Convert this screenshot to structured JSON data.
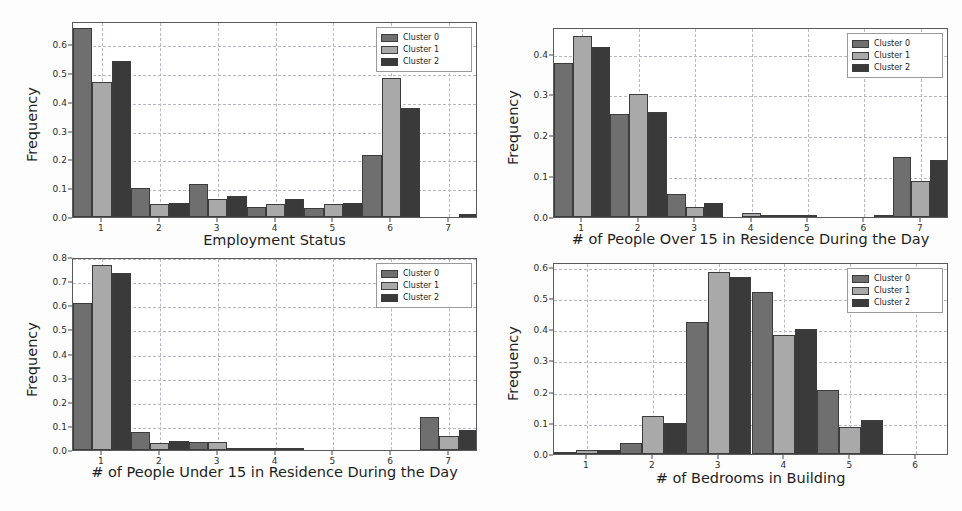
{
  "figure": {
    "background": "#fdfdfd",
    "series_colors": [
      "#6f6f6f",
      "#a9a9a9",
      "#3a3a3a"
    ],
    "legend_labels": [
      "Cluster 0",
      "Cluster 1",
      "Cluster 2"
    ],
    "ylabel": "Frequency"
  },
  "chart_data": [
    {
      "type": "bar",
      "title": "",
      "xlabel": "Employment Status",
      "ylabel": "Frequency",
      "categories": [
        "1",
        "2",
        "3",
        "4",
        "5",
        "6",
        "7"
      ],
      "xlim": [
        0.5,
        7.5
      ],
      "ylim": [
        0.0,
        0.68
      ],
      "yticks": [
        0.0,
        0.1,
        0.2,
        0.3,
        0.4,
        0.5,
        0.6
      ],
      "ytick_labels": [
        "0.0",
        "0.1",
        "0.2",
        "0.3",
        "0.4",
        "0.5",
        "0.6"
      ],
      "grid": true,
      "legend_position": "upper right",
      "series": [
        {
          "name": "Cluster 0",
          "values": [
            0.655,
            0.102,
            0.114,
            0.034,
            0.032,
            0.214,
            0.0
          ]
        },
        {
          "name": "Cluster 1",
          "values": [
            0.468,
            0.046,
            0.061,
            0.044,
            0.044,
            0.482,
            0.0
          ]
        },
        {
          "name": "Cluster 2",
          "values": [
            0.541,
            0.047,
            0.074,
            0.061,
            0.05,
            0.377,
            0.011
          ]
        }
      ]
    },
    {
      "type": "bar",
      "title": "",
      "xlabel": "# of People Over 15 in Residence During the Day",
      "ylabel": "Frequency",
      "categories": [
        "1",
        "2",
        "3",
        "4",
        "5",
        "6",
        "7"
      ],
      "xlim": [
        0.5,
        7.5
      ],
      "ylim": [
        0.0,
        0.465
      ],
      "yticks": [
        0.0,
        0.1,
        0.2,
        0.3,
        0.4
      ],
      "ytick_labels": [
        "0.0",
        "0.1",
        "0.2",
        "0.3",
        "0.4"
      ],
      "grid": true,
      "legend_position": "upper right",
      "series": [
        {
          "name": "Cluster 0",
          "values": [
            0.378,
            0.252,
            0.056,
            0.0,
            0.001,
            0.0,
            0.147
          ]
        },
        {
          "name": "Cluster 1",
          "values": [
            0.444,
            0.301,
            0.024,
            0.011,
            0.001,
            0.0,
            0.087
          ]
        },
        {
          "name": "Cluster 2",
          "values": [
            0.416,
            0.258,
            0.034,
            0.005,
            0.0,
            0.001,
            0.139
          ]
        }
      ]
    },
    {
      "type": "bar",
      "title": "",
      "xlabel": "# of People Under 15 in Residence During the Day",
      "ylabel": "Frequency",
      "categories": [
        "1",
        "2",
        "3",
        "4",
        "5",
        "6",
        "7"
      ],
      "xlim": [
        0.5,
        7.5
      ],
      "ylim": [
        0.0,
        0.8
      ],
      "yticks": [
        0.0,
        0.1,
        0.2,
        0.3,
        0.4,
        0.5,
        0.6,
        0.7,
        0.8
      ],
      "ytick_labels": [
        "0.0",
        "0.1",
        "0.2",
        "0.3",
        "0.4",
        "0.5",
        "0.6",
        "0.7",
        "0.8"
      ],
      "grid": true,
      "legend_position": "upper right",
      "series": [
        {
          "name": "Cluster 0",
          "values": [
            0.609,
            0.076,
            0.034,
            0.003,
            0.0,
            0.0,
            0.135
          ]
        },
        {
          "name": "Cluster 1",
          "values": [
            0.766,
            0.031,
            0.033,
            0.006,
            0.0,
            0.0,
            0.059
          ]
        },
        {
          "name": "Cluster 2",
          "values": [
            0.735,
            0.037,
            0.007,
            0.005,
            0.0,
            0.0,
            0.082
          ]
        }
      ]
    },
    {
      "type": "bar",
      "title": "",
      "xlabel": "# of Bedrooms in Building",
      "ylabel": "Frequency",
      "categories": [
        "1",
        "2",
        "3",
        "4",
        "5",
        "6"
      ],
      "xlim": [
        0.5,
        6.5
      ],
      "ylim": [
        0.0,
        0.615
      ],
      "yticks": [
        0.0,
        0.1,
        0.2,
        0.3,
        0.4,
        0.5,
        0.6
      ],
      "ytick_labels": [
        "0.0",
        "0.1",
        "0.2",
        "0.3",
        "0.4",
        "0.5",
        "0.6"
      ],
      "grid": true,
      "legend_position": "upper right",
      "series": [
        {
          "name": "Cluster 0",
          "values": [
            0.005,
            0.036,
            0.424,
            0.52,
            0.205,
            0.0
          ]
        },
        {
          "name": "Cluster 1",
          "values": [
            0.014,
            0.121,
            0.584,
            0.38,
            0.088,
            0.0
          ]
        },
        {
          "name": "Cluster 2",
          "values": [
            0.013,
            0.099,
            0.567,
            0.399,
            0.109,
            0.0
          ]
        }
      ]
    }
  ]
}
